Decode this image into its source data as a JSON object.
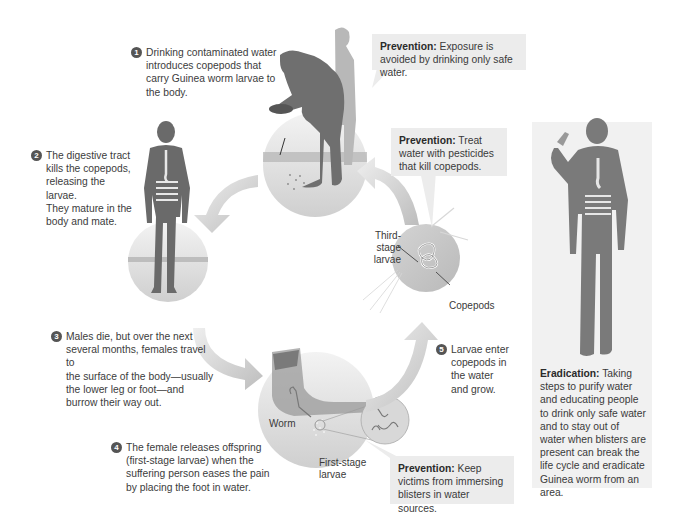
{
  "diagram": {
    "steps": [
      {
        "number": "1",
        "text": "Drinking contaminated water introduces copepods that carry Guinea worm larvae to the body."
      },
      {
        "number": "2",
        "text": "The digestive tract kills the copepods, releasing the larvae. They mature in the body and mate."
      },
      {
        "number": "3",
        "text": "Males die, but over the next several months, females travel to the surface of the body—usually the lower leg or foot—and burrow their way out."
      },
      {
        "number": "4",
        "text": "The female releases offspring (first-stage larvae) when the suffering person eases the pain by placing the foot in water."
      },
      {
        "number": "5",
        "text": "Larvae enter copepods in the water and grow."
      }
    ],
    "step_lines": {
      "s1": [
        "Drinking contaminated water",
        "introduces copepods that",
        "carry Guinea worm larvae to",
        "the body."
      ],
      "s2": [
        "The digestive tract",
        "kills the copepods,",
        "releasing the larvae.",
        "They mature in the",
        "body and mate."
      ],
      "s3": [
        "Males die, but over the next",
        "several months, females travel to",
        "the surface of the body—usually",
        "the lower leg or foot—and",
        "burrow their way out."
      ],
      "s4": [
        "The female releases offspring",
        "(first-stage larvae) when the",
        "suffering person eases the pain",
        "by placing the foot in water."
      ],
      "s5": [
        "Larvae enter",
        "copepods in",
        "the water",
        "and grow."
      ]
    },
    "preventions": [
      {
        "label": "Prevention:",
        "text": " Exposure is avoided by drinking only safe water."
      },
      {
        "label": "Prevention:",
        "text": " Treat water with pesticides that kill copepods."
      },
      {
        "label": "Prevention:",
        "text": " Keep victims from immersing blisters in water sources."
      }
    ],
    "eradication": {
      "label": "Eradication:",
      "text": " Taking steps to purify water and educating people to drink only safe water and to stay out of water when blisters are present can break the life cycle and eradicate Guinea worm from an area."
    },
    "labels": {
      "third_stage_1": "Third-stage",
      "third_stage_2": "larvae",
      "copepods": "Copepods",
      "worm": "Worm",
      "first_stage_1": "First-stage",
      "first_stage_2": "larvae"
    },
    "colors": {
      "background": "#ffffff",
      "callout_bg": "#ececec",
      "silhouette": "#6f6f6f",
      "silhouette_light": "#a9a9a9",
      "arrow": "#c9c9c9",
      "number_badge": "#555555"
    }
  }
}
